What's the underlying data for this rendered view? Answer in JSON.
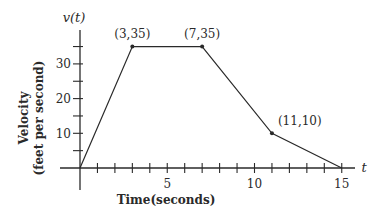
{
  "chart_data": {
    "type": "line",
    "title": "",
    "xlabel": "Time(seconds)",
    "ylabel": "Velocity (feet per second)",
    "ylabel_lines": [
      "Velocity",
      "(feet per second)"
    ],
    "x_axis_name": "t",
    "y_axis_name": "v(t)",
    "xlim": [
      0,
      15
    ],
    "ylim": [
      0,
      35
    ],
    "x_ticks": [
      1,
      2,
      3,
      4,
      5,
      6,
      7,
      8,
      9,
      10,
      11,
      12,
      13,
      14,
      15
    ],
    "x_tick_labels": [
      {
        "value": 5,
        "label": "5"
      },
      {
        "value": 10,
        "label": "10"
      },
      {
        "value": 15,
        "label": "15"
      }
    ],
    "y_ticks": [
      5,
      10,
      15,
      20,
      25,
      30,
      35
    ],
    "y_tick_labels": [
      {
        "value": 10,
        "label": "10"
      },
      {
        "value": 20,
        "label": "20"
      },
      {
        "value": 30,
        "label": "30"
      }
    ],
    "grid": false,
    "series": [
      {
        "name": "v(t)",
        "x": [
          0,
          3,
          7,
          11,
          15
        ],
        "y": [
          0,
          35,
          35,
          10,
          0
        ]
      }
    ],
    "annotations": [
      {
        "x": 3,
        "y": 35,
        "text": "(3,35)"
      },
      {
        "x": 7,
        "y": 35,
        "text": "(7,35)"
      },
      {
        "x": 11,
        "y": 10,
        "text": "(11,10)"
      }
    ],
    "colors": {
      "line": "#2a2a2a",
      "axis": "#2a2a2a"
    }
  }
}
